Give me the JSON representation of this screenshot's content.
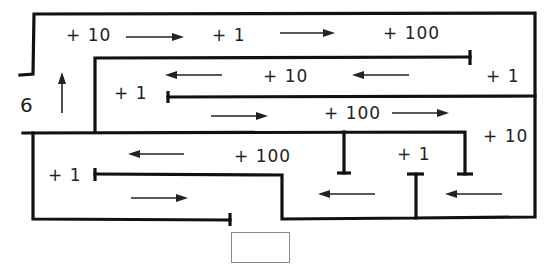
{
  "diagram": {
    "type": "maze",
    "start_label": "6",
    "rewards": [
      {
        "id": "r1",
        "text": "+ 10",
        "x": 66,
        "y": 25
      },
      {
        "id": "r2",
        "text": "+ 1",
        "x": 212,
        "y": 25
      },
      {
        "id": "r3",
        "text": "+ 100",
        "x": 383,
        "y": 23
      },
      {
        "id": "r4",
        "text": "+ 10",
        "x": 263,
        "y": 66
      },
      {
        "id": "r5",
        "text": "+ 1",
        "x": 486,
        "y": 66
      },
      {
        "id": "r6",
        "text": "+ 1",
        "x": 114,
        "y": 83
      },
      {
        "id": "r7",
        "text": "+ 100",
        "x": 324,
        "y": 103
      },
      {
        "id": "r8",
        "text": "+ 10",
        "x": 483,
        "y": 126
      },
      {
        "id": "r9",
        "text": "+ 100",
        "x": 234,
        "y": 146
      },
      {
        "id": "r10",
        "text": "+ 1",
        "x": 397,
        "y": 144
      },
      {
        "id": "r11",
        "text": "+ 1",
        "x": 48,
        "y": 165
      }
    ],
    "arrows": [
      {
        "dir": "up",
        "x1": 62,
        "y1": 113,
        "x2": 62,
        "y2": 73
      },
      {
        "dir": "right",
        "x1": 126,
        "y1": 37,
        "x2": 183,
        "y2": 37
      },
      {
        "dir": "right",
        "x1": 280,
        "y1": 33,
        "x2": 334,
        "y2": 33
      },
      {
        "dir": "left",
        "x1": 222,
        "y1": 75,
        "x2": 166,
        "y2": 75
      },
      {
        "dir": "left",
        "x1": 409,
        "y1": 75,
        "x2": 353,
        "y2": 75
      },
      {
        "dir": "right",
        "x1": 211,
        "y1": 116,
        "x2": 267,
        "y2": 116
      },
      {
        "dir": "right",
        "x1": 392,
        "y1": 113,
        "x2": 448,
        "y2": 113
      },
      {
        "dir": "left",
        "x1": 184,
        "y1": 154,
        "x2": 129,
        "y2": 154
      },
      {
        "dir": "right",
        "x1": 131,
        "y1": 198,
        "x2": 187,
        "y2": 198
      },
      {
        "dir": "left",
        "x1": 375,
        "y1": 194,
        "x2": 319,
        "y2": 194
      },
      {
        "dir": "left",
        "x1": 502,
        "y1": 194,
        "x2": 446,
        "y2": 194
      }
    ],
    "goal_box": {
      "label": ""
    }
  }
}
